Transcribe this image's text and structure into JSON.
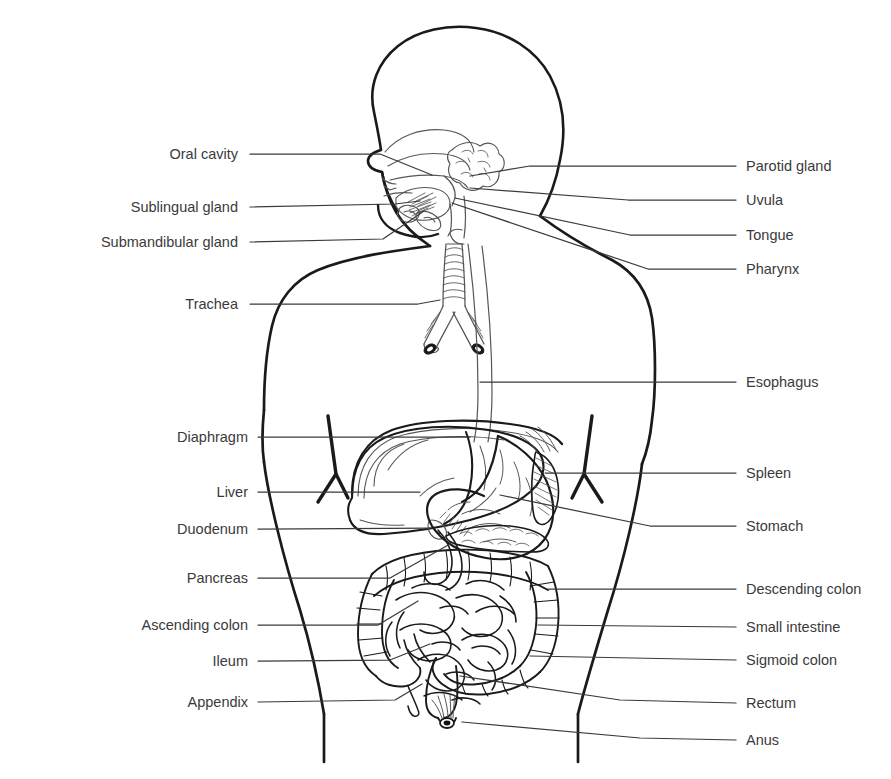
{
  "figure": {
    "kind": "anatomical-diagram",
    "view": "anterior body outline with left-facing head profile",
    "stroke_color": "#1a1a1a",
    "detail_stroke_color": "#55565a",
    "text_color": "#3a3a3c",
    "background_color": "#ffffff"
  },
  "labels_left": [
    {
      "id": "oral-cavity",
      "text": "Oral cavity",
      "text_x": 238,
      "text_y": 154,
      "leader": [
        [
          250,
          154
        ],
        [
          380,
          154
        ],
        [
          432,
          175
        ]
      ]
    },
    {
      "id": "sublingual-gland",
      "text": "Sublingual gland",
      "text_x": 238,
      "text_y": 207,
      "leader": [
        [
          250,
          207
        ],
        [
          395,
          204
        ],
        [
          420,
          201
        ]
      ]
    },
    {
      "id": "submandibular-gland",
      "text": "Submandibular gland",
      "text_x": 238,
      "text_y": 242,
      "leader": [
        [
          250,
          242
        ],
        [
          383,
          239
        ],
        [
          424,
          211
        ]
      ]
    },
    {
      "id": "trachea",
      "text": "Trachea",
      "text_x": 238,
      "text_y": 304,
      "leader": [
        [
          250,
          304
        ],
        [
          418,
          304
        ],
        [
          440,
          300
        ]
      ]
    },
    {
      "id": "diaphragm",
      "text": "Diaphragm",
      "text_x": 248,
      "text_y": 437,
      "leader": [
        [
          258,
          437
        ],
        [
          470,
          437
        ]
      ]
    },
    {
      "id": "liver",
      "text": "Liver",
      "text_x": 248,
      "text_y": 492,
      "leader": [
        [
          258,
          492
        ],
        [
          420,
          492
        ]
      ]
    },
    {
      "id": "duodenum",
      "text": "Duodenum",
      "text_x": 248,
      "text_y": 529,
      "leader": [
        [
          258,
          529
        ],
        [
          430,
          528
        ]
      ]
    },
    {
      "id": "pancreas",
      "text": "Pancreas",
      "text_x": 248,
      "text_y": 578,
      "leader": [
        [
          258,
          578
        ],
        [
          390,
          578
        ],
        [
          450,
          544
        ]
      ]
    },
    {
      "id": "ascending-colon",
      "text": "Ascending colon",
      "text_x": 248,
      "text_y": 625,
      "leader": [
        [
          258,
          625
        ],
        [
          378,
          625
        ],
        [
          418,
          601
        ]
      ]
    },
    {
      "id": "ileum",
      "text": "Ileum",
      "text_x": 248,
      "text_y": 661,
      "leader": [
        [
          258,
          661
        ],
        [
          390,
          660
        ],
        [
          430,
          644
        ]
      ]
    },
    {
      "id": "appendix",
      "text": "Appendix",
      "text_x": 248,
      "text_y": 702,
      "leader": [
        [
          258,
          702
        ],
        [
          395,
          700
        ],
        [
          422,
          684
        ]
      ]
    }
  ],
  "labels_right": [
    {
      "id": "parotid-gland",
      "text": "Parotid gland",
      "text_x": 746,
      "text_y": 166,
      "leader": [
        [
          736,
          166
        ],
        [
          530,
          166
        ],
        [
          470,
          176
        ]
      ]
    },
    {
      "id": "uvula",
      "text": "Uvula",
      "text_x": 746,
      "text_y": 200,
      "leader": [
        [
          736,
          200
        ],
        [
          628,
          200
        ],
        [
          470,
          188
        ]
      ]
    },
    {
      "id": "tongue",
      "text": "Tongue",
      "text_x": 746,
      "text_y": 235,
      "leader": [
        [
          736,
          235
        ],
        [
          630,
          235
        ],
        [
          455,
          198
        ]
      ]
    },
    {
      "id": "pharynx",
      "text": "Pharynx",
      "text_x": 746,
      "text_y": 269,
      "leader": [
        [
          736,
          269
        ],
        [
          648,
          269
        ],
        [
          452,
          203
        ]
      ]
    },
    {
      "id": "esophagus",
      "text": "Esophagus",
      "text_x": 746,
      "text_y": 382,
      "leader": [
        [
          736,
          382
        ],
        [
          480,
          382
        ]
      ]
    },
    {
      "id": "spleen",
      "text": "Spleen",
      "text_x": 746,
      "text_y": 473,
      "leader": [
        [
          736,
          473
        ],
        [
          545,
          473
        ]
      ]
    },
    {
      "id": "stomach",
      "text": "Stomach",
      "text_x": 746,
      "text_y": 526,
      "leader": [
        [
          736,
          526
        ],
        [
          650,
          526
        ],
        [
          500,
          495
        ]
      ]
    },
    {
      "id": "descending-colon",
      "text": "Descending colon",
      "text_x": 746,
      "text_y": 589,
      "leader": [
        [
          736,
          589
        ],
        [
          548,
          589
        ]
      ]
    },
    {
      "id": "small-intestine",
      "text": "Small intestine",
      "text_x": 746,
      "text_y": 627,
      "leader": [
        [
          736,
          627
        ],
        [
          538,
          625
        ]
      ]
    },
    {
      "id": "sigmoid-colon",
      "text": "Sigmoid colon",
      "text_x": 746,
      "text_y": 660,
      "leader": [
        [
          736,
          660
        ],
        [
          530,
          656
        ]
      ]
    },
    {
      "id": "rectum",
      "text": "Rectum",
      "text_x": 746,
      "text_y": 703,
      "leader": [
        [
          736,
          703
        ],
        [
          620,
          700
        ],
        [
          460,
          676
        ]
      ]
    },
    {
      "id": "anus",
      "text": "Anus",
      "text_x": 746,
      "text_y": 740,
      "leader": [
        [
          736,
          740
        ],
        [
          640,
          738
        ],
        [
          462,
          722
        ]
      ]
    }
  ]
}
